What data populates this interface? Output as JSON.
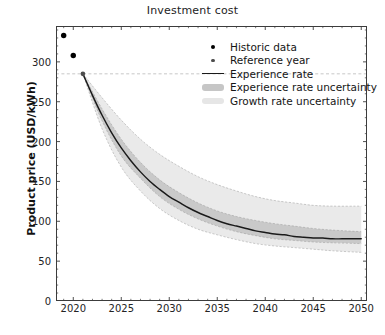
{
  "chart_data": {
    "type": "line",
    "title": "Investment cost",
    "xlabel": "",
    "ylabel": "Product price (USD/kWh)",
    "xlim": [
      2018.2,
      2050.6
    ],
    "ylim": [
      0,
      345
    ],
    "xticks": [
      2020,
      2025,
      2030,
      2035,
      2040,
      2045,
      2050
    ],
    "yticks": [
      0,
      50,
      100,
      150,
      200,
      250,
      300
    ],
    "grid": false,
    "legend_position": "upper right",
    "reference_line_y": 285,
    "series": [
      {
        "name": "Historic data",
        "type": "scatter",
        "marker": "circle",
        "color": "#000000",
        "x": [
          2019,
          2020
        ],
        "values": [
          333,
          308
        ]
      },
      {
        "name": "Reference year",
        "type": "scatter",
        "marker": "circle",
        "color": "#4d4d4d",
        "x": [
          2021
        ],
        "values": [
          285
        ]
      },
      {
        "name": "Experience rate",
        "type": "line",
        "color": "#1a1a1a",
        "x": [
          2021,
          2022,
          2023,
          2024,
          2025,
          2026,
          2027,
          2028,
          2029,
          2030,
          2031,
          2032,
          2033,
          2034,
          2035,
          2036,
          2037,
          2038,
          2039,
          2040,
          2041,
          2042,
          2043,
          2044,
          2045,
          2046,
          2047,
          2048,
          2049,
          2050
        ],
        "values": [
          285,
          258,
          233,
          211,
          192,
          176,
          162,
          150,
          140,
          131,
          124,
          117,
          111,
          106,
          101,
          97,
          94,
          91,
          88,
          86,
          84,
          83,
          81,
          80,
          79,
          79,
          78,
          78,
          78,
          78
        ]
      },
      {
        "name": "Experience rate uncertainty",
        "type": "band",
        "color": "#bdbdbd",
        "x": [
          2021,
          2023,
          2025,
          2027,
          2029,
          2031,
          2033,
          2035,
          2037,
          2039,
          2041,
          2043,
          2045,
          2047,
          2050
        ],
        "lower": [
          285,
          226,
          182,
          154,
          131,
          115,
          103,
          94,
          87,
          82,
          78,
          76,
          74,
          73,
          72
        ],
        "upper": [
          285,
          241,
          203,
          174,
          152,
          136,
          123,
          113,
          106,
          101,
          97,
          94,
          91,
          89,
          87
        ]
      },
      {
        "name": "Growth rate uncertainty",
        "type": "band",
        "color": "#e2e2e2",
        "x": [
          2021,
          2023,
          2025,
          2027,
          2029,
          2031,
          2033,
          2035,
          2037,
          2039,
          2041,
          2043,
          2045,
          2047,
          2050
        ],
        "lower": [
          285,
          216,
          168,
          138,
          116,
          101,
          90,
          83,
          77,
          72,
          69,
          67,
          65,
          63,
          61
        ],
        "upper": [
          285,
          255,
          227,
          203,
          184,
          169,
          156,
          146,
          138,
          131,
          126,
          123,
          120,
          119,
          119
        ]
      }
    ],
    "legend": [
      {
        "label": "Historic data",
        "key": "marker-large"
      },
      {
        "label": "Reference year",
        "key": "marker-small"
      },
      {
        "label": "Experience rate",
        "key": "line"
      },
      {
        "label": "Experience rate uncertainty",
        "key": "patch-dark"
      },
      {
        "label": "Growth rate uncertainty",
        "key": "patch-light"
      }
    ]
  }
}
